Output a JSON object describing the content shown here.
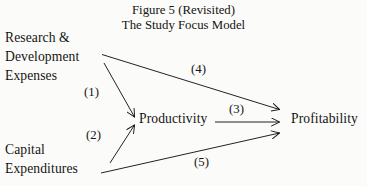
{
  "figure": {
    "title": {
      "line1": "Figure 5 (Revisited)",
      "line2": "The Study Focus Model"
    },
    "background_color": "#fbfbf9",
    "ink_color": "#141414",
    "nodes": [
      {
        "id": "research-development-expenses",
        "label_lines": [
          "Research &",
          "Development",
          "Expenses"
        ],
        "position": "top-left"
      },
      {
        "id": "capital-expenditures",
        "label_lines": [
          "Capital",
          "Expenditures"
        ],
        "position": "bottom-left"
      },
      {
        "id": "productivity",
        "label_lines": [
          "Productivity"
        ],
        "position": "center"
      },
      {
        "id": "profitability",
        "label_lines": [
          "Profitability"
        ],
        "position": "right"
      }
    ],
    "paths": [
      {
        "id": "path-1",
        "label": "(1)",
        "from": "research-development-expenses",
        "to": "productivity"
      },
      {
        "id": "path-2",
        "label": "(2)",
        "from": "capital-expenditures",
        "to": "productivity"
      },
      {
        "id": "path-3",
        "label": "(3)",
        "from": "productivity",
        "to": "profitability"
      },
      {
        "id": "path-4",
        "label": "(4)",
        "from": "research-development-expenses",
        "to": "profitability"
      },
      {
        "id": "path-5",
        "label": "(5)",
        "from": "capital-expenditures",
        "to": "profitability"
      }
    ]
  }
}
